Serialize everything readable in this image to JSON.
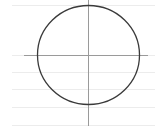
{
  "diagram": {
    "type": "circle-with-axes",
    "width": 158,
    "height": 131,
    "colors": {
      "background": "#ffffff",
      "circle_stroke": "#3a3a3a",
      "axis_stroke": "#9a9a9a",
      "ruled_line": "#ececec"
    },
    "circle": {
      "cx": 88,
      "cy": 54.5,
      "rx": 51,
      "ry": 49.5
    },
    "axes": {
      "horizontal": {
        "x1": 24,
        "x2": 148,
        "y": 55
      },
      "vertical": {
        "x": 88,
        "y1": 0,
        "y2": 126
      }
    },
    "ruled_lines": [
      {
        "y": 5,
        "x1": 12,
        "x2": 155
      },
      {
        "y": 55,
        "x1": 12,
        "x2": 155
      },
      {
        "y": 72,
        "x1": 12,
        "x2": 155
      },
      {
        "y": 89,
        "x1": 12,
        "x2": 155
      },
      {
        "y": 107,
        "x1": 12,
        "x2": 155
      },
      {
        "y": 125,
        "x1": 12,
        "x2": 155
      }
    ]
  }
}
